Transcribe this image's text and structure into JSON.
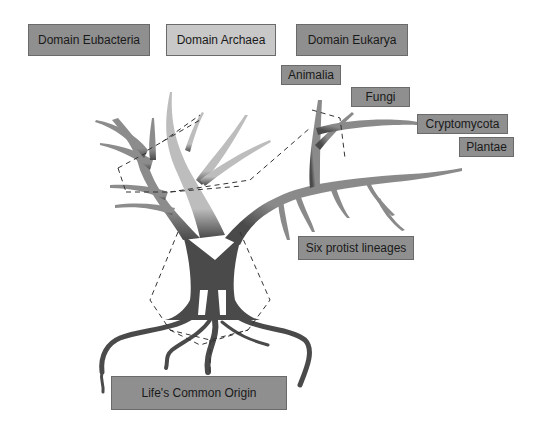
{
  "diagram": {
    "type": "tree-of-life",
    "domains": [
      {
        "label": "Domain Eubacteria",
        "color": "#8f8f8f"
      },
      {
        "label": "Domain Archaea",
        "color": "#c8c8c8"
      },
      {
        "label": "Domain Eukarya",
        "color": "#8f8f8f"
      }
    ],
    "kingdoms": [
      {
        "label": "Animalia"
      },
      {
        "label": "Fungi"
      },
      {
        "label": "Cryptomycota"
      },
      {
        "label": "Plantae"
      }
    ],
    "protists": {
      "label": "Six protist lineages"
    },
    "origin": {
      "label": "Life's Common Origin"
    },
    "colors": {
      "trunk": "#4a4a4a",
      "eubacteria_branch": "#8c8c8c",
      "archaea_branch": "#bdbdbd",
      "eukarya_branch": "#8a8a8a",
      "label_dark": "#8f8f8f",
      "label_light": "#c8c8c8"
    }
  }
}
